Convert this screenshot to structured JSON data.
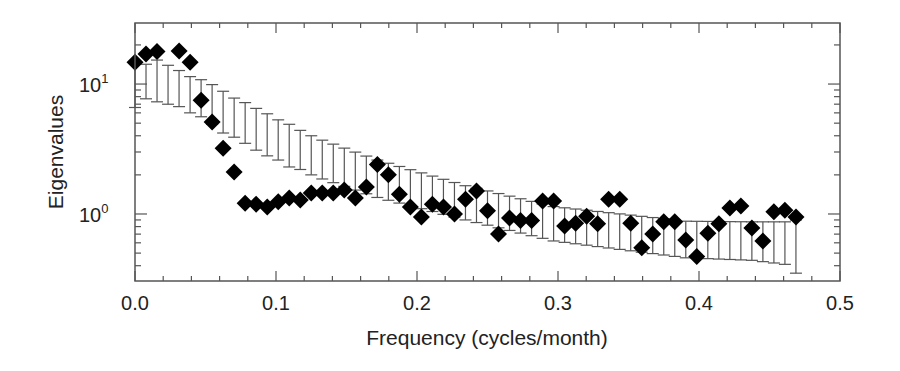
{
  "chart_data": {
    "type": "scatter",
    "title": "",
    "xlabel": "Frequency (cycles/month)",
    "ylabel": "Eigenvalues",
    "xlim": [
      0.0,
      0.5
    ],
    "ylim": [
      0.305,
      29.5
    ],
    "yscale": "log",
    "x_ticks": [
      {
        "value": 0.0,
        "label": "0.0"
      },
      {
        "value": 0.1,
        "label": "0.1"
      },
      {
        "value": 0.2,
        "label": "0.2"
      },
      {
        "value": 0.3,
        "label": "0.3"
      },
      {
        "value": 0.4,
        "label": "0.4"
      },
      {
        "value": 0.5,
        "label": "0.5"
      }
    ],
    "y_ticks": [
      {
        "value": 1,
        "label_base": "10",
        "label_exp": "0"
      },
      {
        "value": 10,
        "label_base": "10",
        "label_exp": "1"
      }
    ],
    "grid": false,
    "legend": null,
    "marker": "diamond",
    "marker_color": "#000000",
    "errorbar_color": "#555555",
    "series": [
      {
        "name": "Eigenvalues",
        "points": [
          {
            "x": 0.0,
            "y": 14.7
          },
          {
            "x": 0.0078,
            "y": 17.0
          },
          {
            "x": 0.0156,
            "y": 17.8
          },
          {
            "x": 0.0313,
            "y": 18.0
          },
          {
            "x": 0.0391,
            "y": 14.7
          },
          {
            "x": 0.0469,
            "y": 7.5
          },
          {
            "x": 0.0547,
            "y": 5.1
          },
          {
            "x": 0.0625,
            "y": 3.2
          },
          {
            "x": 0.0703,
            "y": 2.1
          },
          {
            "x": 0.0781,
            "y": 1.21
          },
          {
            "x": 0.0859,
            "y": 1.19
          },
          {
            "x": 0.0938,
            "y": 1.13
          },
          {
            "x": 0.1016,
            "y": 1.24
          },
          {
            "x": 0.1094,
            "y": 1.33
          },
          {
            "x": 0.1172,
            "y": 1.28
          },
          {
            "x": 0.125,
            "y": 1.45
          },
          {
            "x": 0.1328,
            "y": 1.45
          },
          {
            "x": 0.1406,
            "y": 1.45
          },
          {
            "x": 0.1484,
            "y": 1.53
          },
          {
            "x": 0.1563,
            "y": 1.33
          },
          {
            "x": 0.1641,
            "y": 1.61
          },
          {
            "x": 0.1719,
            "y": 2.4
          },
          {
            "x": 0.1797,
            "y": 2.0
          },
          {
            "x": 0.1875,
            "y": 1.42
          },
          {
            "x": 0.1953,
            "y": 1.13
          },
          {
            "x": 0.2031,
            "y": 0.95
          },
          {
            "x": 0.2109,
            "y": 1.19
          },
          {
            "x": 0.2188,
            "y": 1.13
          },
          {
            "x": 0.2266,
            "y": 1.0
          },
          {
            "x": 0.2344,
            "y": 1.3
          },
          {
            "x": 0.2422,
            "y": 1.5
          },
          {
            "x": 0.25,
            "y": 1.06
          },
          {
            "x": 0.2578,
            "y": 0.7
          },
          {
            "x": 0.2656,
            "y": 0.93
          },
          {
            "x": 0.2734,
            "y": 0.89
          },
          {
            "x": 0.2813,
            "y": 0.89
          },
          {
            "x": 0.2891,
            "y": 1.26
          },
          {
            "x": 0.2969,
            "y": 1.26
          },
          {
            "x": 0.3047,
            "y": 0.81
          },
          {
            "x": 0.3125,
            "y": 0.85
          },
          {
            "x": 0.3203,
            "y": 0.96
          },
          {
            "x": 0.3281,
            "y": 0.84
          },
          {
            "x": 0.3359,
            "y": 1.3
          },
          {
            "x": 0.3438,
            "y": 1.3
          },
          {
            "x": 0.3516,
            "y": 0.85
          },
          {
            "x": 0.3594,
            "y": 0.55
          },
          {
            "x": 0.3672,
            "y": 0.7
          },
          {
            "x": 0.375,
            "y": 0.87
          },
          {
            "x": 0.3828,
            "y": 0.87
          },
          {
            "x": 0.3906,
            "y": 0.63
          },
          {
            "x": 0.3984,
            "y": 0.47
          },
          {
            "x": 0.4063,
            "y": 0.71
          },
          {
            "x": 0.4141,
            "y": 0.84
          },
          {
            "x": 0.4219,
            "y": 1.11
          },
          {
            "x": 0.4297,
            "y": 1.15
          },
          {
            "x": 0.4375,
            "y": 0.78
          },
          {
            "x": 0.4453,
            "y": 0.62
          },
          {
            "x": 0.4531,
            "y": 1.04
          },
          {
            "x": 0.4609,
            "y": 1.07
          },
          {
            "x": 0.4688,
            "y": 0.95
          }
        ]
      },
      {
        "name": "Error bars (confidence range)",
        "anchors_x_upper_lower": [
          [
            0.0,
            14.6,
            6.6
          ],
          [
            0.0078,
            14.2,
            7.7
          ],
          [
            0.0156,
            15.3,
            7.3
          ],
          [
            0.0313,
            12.7,
            6.7
          ],
          [
            0.0391,
            11.4,
            6.0
          ],
          [
            0.0469,
            10.8,
            5.6
          ],
          [
            0.0547,
            9.9,
            4.9
          ],
          [
            0.0625,
            8.8,
            4.2
          ],
          [
            0.0703,
            7.8,
            3.9
          ],
          [
            0.0781,
            7.2,
            3.5
          ],
          [
            0.0859,
            6.5,
            3.1
          ],
          [
            0.0938,
            5.9,
            2.8
          ],
          [
            0.1016,
            5.3,
            2.6
          ],
          [
            0.1094,
            4.9,
            2.3
          ],
          [
            0.1172,
            4.4,
            2.2
          ],
          [
            0.125,
            4.0,
            2.0
          ],
          [
            0.1328,
            3.7,
            1.86
          ],
          [
            0.1719,
            2.6,
            1.34
          ],
          [
            0.2344,
            1.65,
            0.9
          ],
          [
            0.2969,
            1.14,
            0.62
          ],
          [
            0.3906,
            0.88,
            0.46
          ],
          [
            0.4375,
            0.87,
            0.44
          ],
          [
            0.4609,
            0.87,
            0.41
          ],
          [
            0.4688,
            0.9,
            0.35
          ]
        ]
      }
    ]
  }
}
